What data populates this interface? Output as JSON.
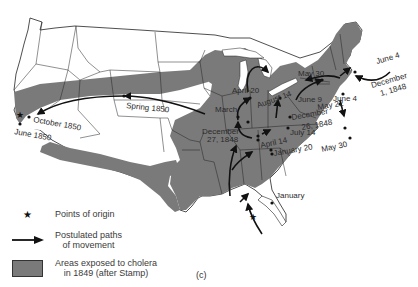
{
  "figure": {
    "panel_label": "(c)"
  },
  "colors": {
    "exposed_area": "#7a7a7a",
    "state_lines": "#222222",
    "paths": "#111111",
    "background": "#ffffff"
  },
  "map_labels": [
    {
      "id": "spring-1850",
      "text": "Spring 1850"
    },
    {
      "id": "october-1850",
      "text": "October 1850"
    },
    {
      "id": "june-1850",
      "text": "June 1850"
    },
    {
      "id": "april-20",
      "text": "April 20"
    },
    {
      "id": "march",
      "text": "March"
    },
    {
      "id": "december-27-1848-line1",
      "text": "December"
    },
    {
      "id": "december-27-1848-line2",
      "text": "27, 1848"
    },
    {
      "id": "august-14",
      "text": "August 14"
    },
    {
      "id": "may-30-north",
      "text": "May 30"
    },
    {
      "id": "june-4-ne",
      "text": "June 4"
    },
    {
      "id": "december-1-1848-line1",
      "text": "December"
    },
    {
      "id": "december-1-1848-line2",
      "text": "1, 1848"
    },
    {
      "id": "june-9",
      "text": "June 9"
    },
    {
      "id": "june-4-east",
      "text": "June 4"
    },
    {
      "id": "may-22",
      "text": "May 22"
    },
    {
      "id": "december-26-1848-line1",
      "text": "December"
    },
    {
      "id": "december-26-1848-line2",
      "text": "26, 1848"
    },
    {
      "id": "july-14",
      "text": "July 14"
    },
    {
      "id": "april-14",
      "text": "April 14"
    },
    {
      "id": "january-20",
      "text": "January 20"
    },
    {
      "id": "may-30-south",
      "text": "May 30"
    },
    {
      "id": "january",
      "text": "January"
    }
  ],
  "legend": {
    "items": [
      {
        "symbol": "star-icon",
        "label_lines": [
          "Points of origin"
        ]
      },
      {
        "symbol": "arrow-icon",
        "label_lines": [
          "Postulated paths",
          "of movement"
        ]
      },
      {
        "symbol": "gray-swatch",
        "label_lines": [
          "Areas exposed to cholera",
          "in 1849 (after Stamp)"
        ]
      }
    ]
  }
}
